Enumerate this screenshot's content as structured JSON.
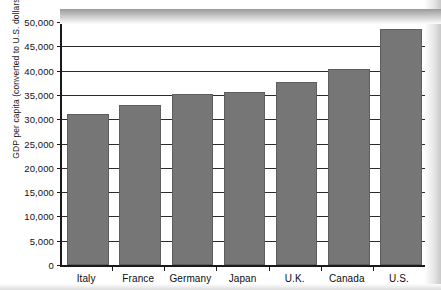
{
  "chart_data": {
    "type": "bar",
    "title": "",
    "subtitle": "",
    "xlabel": "",
    "ylabel": "GDP per capita (converted to U.S. dollars)",
    "categories": [
      "Italy",
      "France",
      "Germany",
      "Japan",
      "U.K.",
      "Canada",
      "U.S."
    ],
    "values": [
      31000,
      33000,
      35200,
      35500,
      37700,
      40300,
      48500
    ],
    "series": [
      {
        "name": "GDP per capita",
        "values": [
          31000,
          33000,
          35200,
          35500,
          37700,
          40300,
          48500
        ]
      }
    ],
    "ylim": [
      0,
      50000
    ],
    "ytick_labels": [
      "0",
      "5,000",
      "10,000",
      "15,000",
      "20,000",
      "25,000",
      "30,000",
      "35,000",
      "40,000",
      "45,000",
      "50,000"
    ],
    "ytick_values": [
      0,
      5000,
      10000,
      15000,
      20000,
      25000,
      30000,
      35000,
      40000,
      45000,
      50000
    ],
    "ytick_interval": 5000,
    "grid": true,
    "grid_axis": "y",
    "legend": false,
    "legend_position": "none",
    "bar_color": "#767676",
    "bar_border_color": "#5e5e5e",
    "axis_color": "#1a1a1a",
    "gridline_color": "#2b2b2b",
    "background_color": "#ffffff",
    "annotations": []
  }
}
